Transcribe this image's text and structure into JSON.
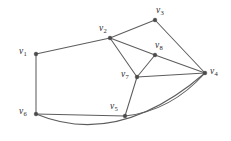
{
  "figure": {
    "kind": "undirected-graph-drawing",
    "background_color": "#ffffff",
    "edge_color": "#5d5d5d",
    "vertex_color": "#4a4a4a",
    "label_color": "#2b2b2b",
    "width": 231,
    "height": 141
  },
  "vertices": [
    {
      "id": "v1",
      "letter": "v",
      "index": "1",
      "x": 36,
      "y": 54,
      "label_x": 19,
      "label_y": 47
    },
    {
      "id": "v2",
      "letter": "v",
      "index": "2",
      "x": 110,
      "y": 38,
      "label_x": 99,
      "label_y": 24
    },
    {
      "id": "v3",
      "letter": "v",
      "index": "3",
      "x": 155,
      "y": 20,
      "label_x": 156,
      "label_y": 6
    },
    {
      "id": "v4",
      "letter": "v",
      "index": "4",
      "x": 205,
      "y": 73,
      "label_x": 210,
      "label_y": 67
    },
    {
      "id": "v5",
      "letter": "v",
      "index": "5",
      "x": 125,
      "y": 116,
      "label_x": 110,
      "label_y": 102
    },
    {
      "id": "v6",
      "letter": "v",
      "index": "6",
      "x": 36,
      "y": 114,
      "label_x": 19,
      "label_y": 107
    },
    {
      "id": "v7",
      "letter": "v",
      "index": "7",
      "x": 137,
      "y": 77,
      "label_x": 121,
      "label_y": 70
    },
    {
      "id": "v8",
      "letter": "v",
      "index": "8",
      "x": 155,
      "y": 55,
      "label_x": 155,
      "label_y": 41
    }
  ],
  "edges": [
    {
      "id": "e-v1-v2",
      "from": "v1",
      "to": "v2",
      "shape": "M 36 54 L 110 38"
    },
    {
      "id": "e-v1-v6",
      "from": "v1",
      "to": "v6",
      "shape": "M 36 54 L 36 114"
    },
    {
      "id": "e-v2-v3",
      "from": "v2",
      "to": "v3",
      "shape": "M 110 38 L 155 20"
    },
    {
      "id": "e-v2-v8",
      "from": "v2",
      "to": "v8",
      "shape": "M 110 38 L 155 55"
    },
    {
      "id": "e-v2-v7",
      "from": "v2",
      "to": "v7",
      "shape": "M 110 38 L 137 77"
    },
    {
      "id": "e-v3-v4",
      "from": "v3",
      "to": "v4",
      "shape": "M 155 20 L 205 73"
    },
    {
      "id": "e-v8-v7",
      "from": "v8",
      "to": "v7",
      "shape": "M 155 55 L 137 77"
    },
    {
      "id": "e-v8-v4",
      "from": "v8",
      "to": "v4",
      "shape": "M 155 55 L 205 73"
    },
    {
      "id": "e-v7-v4",
      "from": "v7",
      "to": "v4",
      "shape": "M 137 77 L 205 73"
    },
    {
      "id": "e-v7-v5",
      "from": "v7",
      "to": "v5",
      "shape": "M 137 77 L 125 116"
    },
    {
      "id": "e-v5-v6",
      "from": "v5",
      "to": "v6",
      "shape": "M 125 116 L 36 114"
    },
    {
      "id": "e-v5-v4",
      "from": "v5",
      "to": "v4",
      "shape": "M 125 116 Q 171 111 205 73"
    },
    {
      "id": "e-v6-v4",
      "from": "v6",
      "to": "v4",
      "shape": "M 36 114 Q 118 148 205 73"
    }
  ]
}
